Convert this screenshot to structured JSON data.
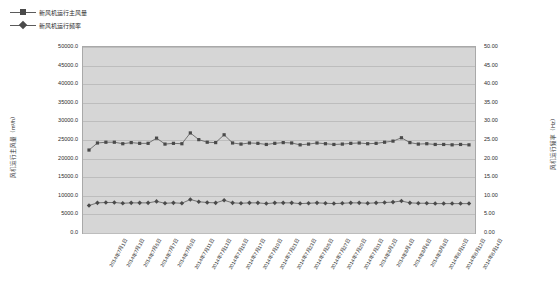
{
  "legend": [
    {
      "name": "series-airflow",
      "label": "新风机运行主风量",
      "marker": "square",
      "color": "#4a4a4a"
    },
    {
      "name": "series-frequency",
      "label": "新风机运行频率",
      "marker": "diamond",
      "color": "#4a4a4a"
    }
  ],
  "axis": {
    "left_title": "风机运行主风量（m³/h）",
    "right_title": "风机运行频率（Hz）",
    "left_ticks": [
      "50000.0",
      "45000.0",
      "40000.0",
      "35000.0",
      "30000.0",
      "25000.0",
      "20000.0",
      "15000.0",
      "10000.0",
      "5000.0",
      "0.0"
    ],
    "right_ticks": [
      "50.00",
      "45.00",
      "40.00",
      "35.00",
      "30.00",
      "25.00",
      "20.00",
      "15.00",
      "10.00",
      "5.00",
      "0.00"
    ]
  },
  "chart_data": {
    "type": "line",
    "title": "",
    "xlabel": "",
    "ylabel": "风机运行主风量（m³/h）",
    "y2label": "风机运行频率（Hz）",
    "ylim": [
      0,
      50000
    ],
    "y2lim": [
      0,
      50
    ],
    "grid": true,
    "legend_position": "top-left",
    "categories": [
      "2014年7月1日",
      "2014年7月2日",
      "2014年7月3日",
      "2014年7月4日",
      "2014年7月5日",
      "2014年7月6日",
      "2014年7月7日",
      "2014年7月8日",
      "2014年7月9日",
      "2014年7月10日",
      "2014年7月11日",
      "2014年7月12日",
      "2014年7月13日",
      "2014年7月14日",
      "2014年7月15日",
      "2014年7月16日",
      "2014年7月17日",
      "2014年7月18日",
      "2014年7月19日",
      "2014年7月20日",
      "2014年7月21日",
      "2014年7月22日",
      "2014年7月23日",
      "2014年7月24日",
      "2014年7月25日",
      "2014年7月26日",
      "2014年7月27日",
      "2014年7月28日",
      "2014年7月29日",
      "2014年7月30日",
      "2014年7月31日",
      "2014年8月1日",
      "2014年8月2日",
      "2014年8月3日",
      "2014年8月4日",
      "2014年8月5日",
      "2014年8月6日",
      "2014年8月7日",
      "2014年8月8日",
      "2014年8月9日",
      "2014年8月10日",
      "2014年8月11日",
      "2014年8月12日",
      "2014年8月13日",
      "2014年8月14日",
      "2014年8月15日"
    ],
    "x_tick_labels": [
      "2014年7月1日",
      "2014年7月3日",
      "2014年7月5日",
      "2014年7月7日",
      "2014年7月9日",
      "2014年7月11日",
      "2014年7月13日",
      "2014年7月15日",
      "2014年7月17日",
      "2014年7月19日",
      "2014年7月21日",
      "2014年7月23日",
      "2014年7月25日",
      "2014年7月27日",
      "2014年7月29日",
      "2014年7月31日",
      "2014年8月2日",
      "2014年8月4日",
      "2014年8月6日",
      "2014年8月8日",
      "2014年8月10日",
      "2014年8月12日",
      "2014年8月14日"
    ],
    "series": [
      {
        "name": "新风机运行主风量",
        "axis": "left",
        "marker": "square",
        "values": [
          22300,
          24200,
          24400,
          24400,
          24000,
          24300,
          24100,
          24100,
          25500,
          23900,
          24100,
          24000,
          26900,
          25100,
          24400,
          24300,
          26400,
          24200,
          23900,
          24200,
          24100,
          23800,
          24100,
          24300,
          24200,
          23700,
          23900,
          24200,
          24000,
          23800,
          23900,
          24100,
          24200,
          24000,
          24100,
          24400,
          24700,
          25600,
          24300,
          23900,
          24000,
          23800,
          23800,
          23700,
          23800,
          23700
        ]
      },
      {
        "name": "新风机运行频率",
        "axis": "right",
        "marker": "diamond",
        "values": [
          7.4,
          8.1,
          8.2,
          8.2,
          8.0,
          8.1,
          8.1,
          8.1,
          8.5,
          8.0,
          8.1,
          8.0,
          9.0,
          8.4,
          8.2,
          8.1,
          8.8,
          8.1,
          8.0,
          8.1,
          8.1,
          7.9,
          8.1,
          8.1,
          8.1,
          7.9,
          8.0,
          8.1,
          8.0,
          7.9,
          8.0,
          8.1,
          8.1,
          8.0,
          8.1,
          8.2,
          8.3,
          8.6,
          8.1,
          8.0,
          8.0,
          7.9,
          7.9,
          7.9,
          7.9,
          7.9
        ]
      }
    ]
  },
  "colors": {
    "plot_background": "#d6d6d6",
    "grid": "#bdbdbd",
    "series_line": "#5b5b5b",
    "marker": "#4a4a4a",
    "text": "#2b2b2b"
  }
}
